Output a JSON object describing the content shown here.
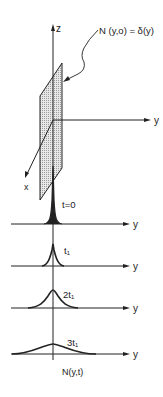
{
  "diagram": {
    "title_label": "N (y,o) = δ(y)",
    "axes": {
      "z": "z",
      "y": "y",
      "x": "x"
    },
    "curves": [
      {
        "label": "t=0",
        "width": 3,
        "height": 58
      },
      {
        "label": "t₁",
        "width": 6,
        "height": 22
      },
      {
        "label": "2t₁",
        "width": 12,
        "height": 18
      },
      {
        "label": "3t₁",
        "width": 24,
        "height": 10
      }
    ],
    "curve_axis_label": "y",
    "bottom_label": "N(y,t)",
    "colors": {
      "ink": "#222222",
      "plane_fill": "#d8d8d8",
      "background": "#ffffff"
    }
  }
}
